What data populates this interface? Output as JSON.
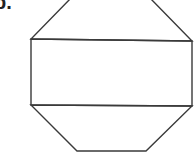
{
  "problem_label": "b.",
  "diagram": {
    "stroke_color": "#3a3a3a",
    "shapes": [
      {
        "name": "top-trapezoid",
        "points": [
          [
            71,
            -2
          ],
          [
            150,
            -2
          ],
          [
            192,
            41
          ],
          [
            31,
            39
          ]
        ]
      },
      {
        "name": "middle-rectangle",
        "points": [
          [
            31,
            39
          ],
          [
            192,
            41
          ],
          [
            192,
            106
          ],
          [
            31,
            105
          ]
        ]
      },
      {
        "name": "bottom-trapezoid",
        "points": [
          [
            31,
            105
          ],
          [
            192,
            106
          ],
          [
            146,
            151
          ],
          [
            77,
            151
          ]
        ]
      }
    ]
  }
}
